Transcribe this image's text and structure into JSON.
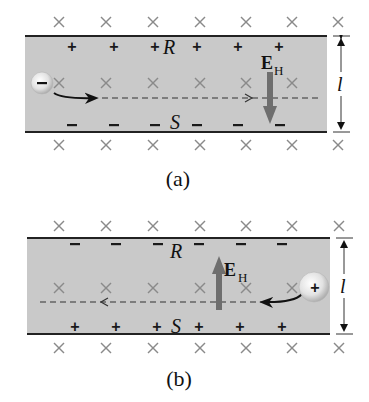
{
  "figure": {
    "colors": {
      "strip_fill": "#c9c9c9",
      "edge": "#222222",
      "x_marker": "#8a8a8a",
      "field_arrow": "#6e6e6e",
      "particle_fill": "#e6e6e6"
    },
    "panels": [
      {
        "id": "a",
        "caption": "(a)",
        "top_label": "R",
        "bottom_label": "S",
        "top_sign": "+",
        "bottom_sign": "−",
        "particle_sign": "−",
        "particle_type": "electron",
        "field_label": "E",
        "field_subscript": "H",
        "field_direction": "down",
        "motion_direction": "right",
        "dimension_label": "l"
      },
      {
        "id": "b",
        "caption": "(b)",
        "top_label": "R",
        "bottom_label": "S",
        "top_sign": "−",
        "bottom_sign": "+",
        "particle_sign": "+",
        "particle_type": "proton",
        "field_label": "E",
        "field_subscript": "H",
        "field_direction": "up",
        "motion_direction": "left",
        "dimension_label": "l"
      }
    ],
    "magnetic_field_symbol": "×"
  }
}
